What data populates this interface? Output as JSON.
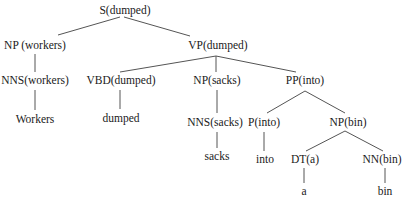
{
  "diagram": {
    "type": "dependency-annotated constituency parse tree",
    "sentence": "Workers dumped sacks into a bin",
    "nodes": [
      {
        "id": "S",
        "label": "S(dumped)",
        "x": 125,
        "y": 11
      },
      {
        "id": "NP1",
        "label": "NP (workers)",
        "x": 35,
        "y": 46
      },
      {
        "id": "VP",
        "label": "VP(dumped)",
        "x": 218,
        "y": 46
      },
      {
        "id": "NNS1",
        "label": "NNS(workers)",
        "x": 35,
        "y": 81
      },
      {
        "id": "VBD",
        "label": "VBD(dumped)",
        "x": 121,
        "y": 81
      },
      {
        "id": "NP2",
        "label": "NP(sacks)",
        "x": 217,
        "y": 81
      },
      {
        "id": "PP",
        "label": "PP(into)",
        "x": 305,
        "y": 81
      },
      {
        "id": "W1",
        "label": "Workers",
        "x": 35,
        "y": 120
      },
      {
        "id": "W2",
        "label": "dumped",
        "x": 121,
        "y": 119
      },
      {
        "id": "NNS2",
        "label": "NNS(sacks)",
        "x": 215,
        "y": 123
      },
      {
        "id": "P",
        "label": "P(into)",
        "x": 264,
        "y": 123
      },
      {
        "id": "NP3",
        "label": "NP(bin)",
        "x": 348,
        "y": 123
      },
      {
        "id": "W3",
        "label": "sacks",
        "x": 217,
        "y": 157
      },
      {
        "id": "W4",
        "label": "into",
        "x": 265,
        "y": 160
      },
      {
        "id": "DT",
        "label": "DT(a)",
        "x": 305,
        "y": 160
      },
      {
        "id": "NN",
        "label": "NN(bin)",
        "x": 382,
        "y": 160
      },
      {
        "id": "W5",
        "label": "a",
        "x": 304,
        "y": 192
      },
      {
        "id": "W6",
        "label": "bin",
        "x": 385,
        "y": 192
      }
    ],
    "edges": [
      {
        "from": "S",
        "to": "NP1",
        "x1": 120,
        "y1": 17,
        "x2": 58,
        "y2": 35
      },
      {
        "from": "S",
        "to": "VP",
        "x1": 124,
        "y1": 17,
        "x2": 190,
        "y2": 36
      },
      {
        "from": "NP1",
        "to": "NNS1",
        "x1": 35,
        "y1": 54,
        "x2": 35,
        "y2": 72
      },
      {
        "from": "VP",
        "to": "VBD",
        "x1": 216,
        "y1": 56,
        "x2": 120,
        "y2": 72
      },
      {
        "from": "VP",
        "to": "NP2",
        "x1": 216,
        "y1": 56,
        "x2": 216,
        "y2": 72
      },
      {
        "from": "VP",
        "to": "PP",
        "x1": 216,
        "y1": 56,
        "x2": 296,
        "y2": 72
      },
      {
        "from": "NNS1",
        "to": "W1",
        "x1": 35,
        "y1": 90,
        "x2": 35,
        "y2": 110
      },
      {
        "from": "VBD",
        "to": "W2",
        "x1": 120,
        "y1": 90,
        "x2": 120,
        "y2": 109
      },
      {
        "from": "NP2",
        "to": "NNS2",
        "x1": 217,
        "y1": 90,
        "x2": 217,
        "y2": 113
      },
      {
        "from": "PP",
        "to": "P",
        "x1": 305,
        "y1": 91,
        "x2": 267,
        "y2": 113
      },
      {
        "from": "PP",
        "to": "NP3",
        "x1": 305,
        "y1": 91,
        "x2": 345,
        "y2": 113
      },
      {
        "from": "NNS2",
        "to": "W3",
        "x1": 217,
        "y1": 132,
        "x2": 217,
        "y2": 148
      },
      {
        "from": "P",
        "to": "W4",
        "x1": 264,
        "y1": 132,
        "x2": 264,
        "y2": 151
      },
      {
        "from": "NP3",
        "to": "DT",
        "x1": 345,
        "y1": 131,
        "x2": 306,
        "y2": 151
      },
      {
        "from": "NP3",
        "to": "NN",
        "x1": 345,
        "y1": 131,
        "x2": 383,
        "y2": 151
      },
      {
        "from": "DT",
        "to": "W5",
        "x1": 304,
        "y1": 168,
        "x2": 304,
        "y2": 183
      },
      {
        "from": "NN",
        "to": "W6",
        "x1": 385,
        "y1": 168,
        "x2": 385,
        "y2": 183
      }
    ],
    "colors": {
      "line": "#555555",
      "text": "#1a1a1a",
      "background": "#ffffff"
    }
  }
}
